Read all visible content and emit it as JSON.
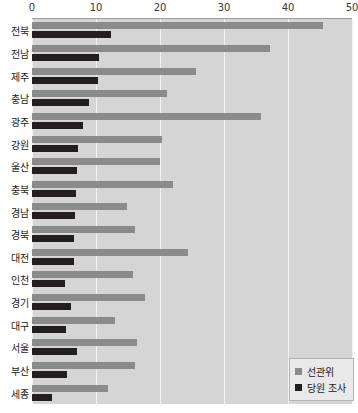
{
  "chart_data": {
    "type": "bar",
    "orientation": "horizontal",
    "title": "",
    "subtitle": "",
    "xlabel": "",
    "ylabel": "",
    "xlim": [
      0,
      50
    ],
    "xticks": [
      0,
      10,
      20,
      30,
      40,
      50
    ],
    "xtick_labels": [
      "0",
      "10",
      "20",
      "30",
      "40",
      "50"
    ],
    "grid": true,
    "grid_axis": "x",
    "legend_position": "bottom-right",
    "categories": [
      "전북",
      "전남",
      "제주",
      "충남",
      "광주",
      "강원",
      "울산",
      "충북",
      "경남",
      "경북",
      "대전",
      "인천",
      "경기",
      "대구",
      "서울",
      "부산",
      "세종"
    ],
    "series": [
      {
        "name": "선관위",
        "color": "#8b8b8b",
        "values": [
          45.5,
          37.2,
          25.6,
          21.1,
          35.8,
          20.3,
          20.0,
          22.1,
          14.8,
          16.1,
          24.4,
          15.8,
          17.6,
          12.9,
          16.4,
          16.1,
          11.8
        ]
      },
      {
        "name": "당원 조사",
        "color": "#231f20",
        "values": [
          12.3,
          10.5,
          10.3,
          8.9,
          7.9,
          7.2,
          7.0,
          6.8,
          6.7,
          6.6,
          6.6,
          5.1,
          6.1,
          5.3,
          7.0,
          5.5,
          3.1
        ]
      }
    ],
    "colors": {
      "series_a": "#8b8b8b",
      "series_b": "#231f20",
      "plot_background": "#d5d5d5",
      "gridline": "#f2f2f2",
      "axis_rule": "#9a9a9a",
      "page_background": "#ffffff",
      "legend_background": "#e9e9e9",
      "legend_border": "#b5b5b5",
      "text": "#1a1a1a"
    }
  },
  "legend": {
    "items": [
      {
        "label": "선관위",
        "color": "#8b8b8b"
      },
      {
        "label": "당원 조사",
        "color": "#231f20"
      }
    ]
  }
}
